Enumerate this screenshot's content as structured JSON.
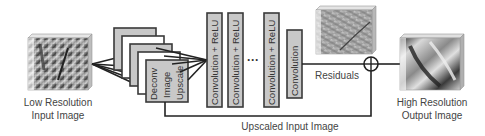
{
  "diagram": {
    "input": {
      "label_line1": "Low Resolution",
      "label_line2": "Input Image"
    },
    "upscale_block": {
      "label_lines": [
        "Deconv",
        "Image",
        "Upscale"
      ],
      "stack_layers": 5
    },
    "layers": [
      {
        "label": "Convolution + ReLU"
      },
      {
        "label": "Convolution + ReLU"
      },
      {
        "label": "Convolution + ReLU"
      },
      {
        "label": "Convolution"
      }
    ],
    "ellipsis": "···",
    "residuals_label": "Residuals",
    "sum_node": "⊕",
    "skip_connection_label": "Upscaled Input Image",
    "output": {
      "label_line1": "High Resolution",
      "label_line2": "Output Image"
    },
    "colors": {
      "box_fill": "#c8c8c8",
      "box_fill_light": "#ffffff",
      "stroke": "#3a3a3a",
      "text": "#444444"
    }
  }
}
